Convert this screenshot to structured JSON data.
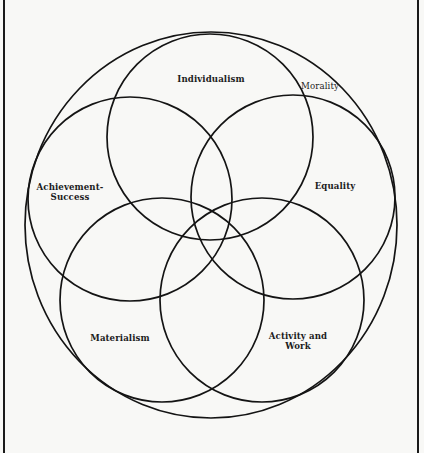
{
  "diagram": {
    "type": "venn-rosette",
    "outer_circle": {
      "label": "Morality",
      "cx": 211,
      "cy": 225,
      "rx": 186,
      "ry": 193
    },
    "circles": [
      {
        "id": "individualism",
        "label_lines": [
          "Individualism"
        ],
        "cx": 210,
        "cy": 137,
        "r": 103
      },
      {
        "id": "achievement-success",
        "label_lines": [
          "Achievement-",
          "Success"
        ],
        "cx": 130,
        "cy": 199,
        "r": 102
      },
      {
        "id": "equality",
        "label_lines": [
          "Equality"
        ],
        "cx": 293,
        "cy": 197,
        "r": 102
      },
      {
        "id": "materialism",
        "label_lines": [
          "Materialism"
        ],
        "cx": 162,
        "cy": 300,
        "r": 102
      },
      {
        "id": "activity-and-work",
        "label_lines": [
          "Activity and",
          "Work"
        ],
        "cx": 262,
        "cy": 300,
        "r": 102
      }
    ],
    "labels": {
      "individualism": "Individualism",
      "morality": "Morality",
      "achievement_line1": "Achievement-",
      "achievement_line2": "Success",
      "equality": "Equality",
      "materialism": "Materialism",
      "activity_line1": "Activity and",
      "activity_line2": "Work"
    },
    "colors": {
      "background": "#f8f8f6",
      "stroke": "#141414",
      "text": "#1c1c1c"
    }
  }
}
